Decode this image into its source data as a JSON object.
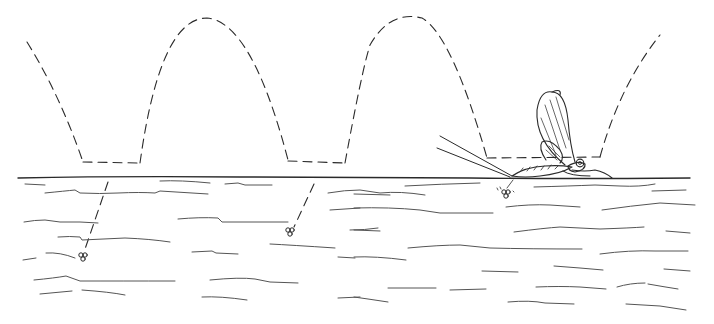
{
  "figure": {
    "subject": "Mayfly ovipositing on water surface",
    "colors": {
      "background": "#ffffff",
      "ink": "#2a2a2a",
      "water_lines": "#555555"
    },
    "flight_path": {
      "style": "dashed",
      "arches": 4,
      "touch_points_x": [
        110,
        315,
        510
      ]
    },
    "egg_clusters": [
      {
        "label": "egg-cluster-1",
        "x": 83,
        "y": 257
      },
      {
        "label": "egg-cluster-2",
        "x": 290,
        "y": 232
      },
      {
        "label": "egg-cluster-3",
        "x": 506,
        "y": 193
      }
    ],
    "water_surface_y": 178
  }
}
